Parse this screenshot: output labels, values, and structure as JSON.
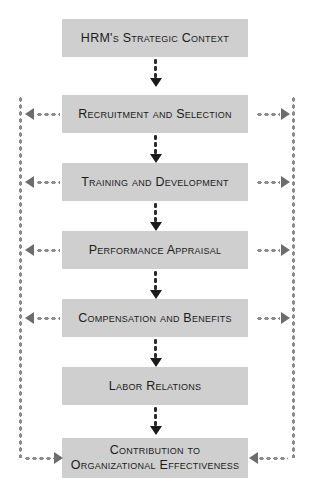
{
  "diagram": {
    "colors": {
      "box_fill": "#cfcfcf",
      "box_text": "#1b1b1b",
      "connector": "#1b1b1b",
      "feedback_rail": "#8c8c8c",
      "feedback_arrow": "#6d6d6d",
      "background": "#ffffff"
    },
    "boxes": [
      {
        "id": "hrm-strategic-context",
        "label": "HRM's Strategic Context"
      },
      {
        "id": "recruitment-and-selection",
        "label": "Recruitment and Selection"
      },
      {
        "id": "training-and-development",
        "label": "Training and Development"
      },
      {
        "id": "performance-appraisal",
        "label": "Performance Appraisal"
      },
      {
        "id": "compensation-and-benefits",
        "label": "Compensation and Benefits"
      },
      {
        "id": "labor-relations",
        "label": "Labor Relations"
      },
      {
        "id": "contribution-to-organizational-effectiveness",
        "label": "Contribution to\nOrganizational Effectiveness"
      }
    ],
    "flow_connectors": [
      {
        "from": "hrm-strategic-context",
        "to": "recruitment-and-selection",
        "style": "dotted-arrow-down"
      },
      {
        "from": "recruitment-and-selection",
        "to": "training-and-development",
        "style": "dotted-arrow-down"
      },
      {
        "from": "training-and-development",
        "to": "performance-appraisal",
        "style": "dotted-arrow-down"
      },
      {
        "from": "performance-appraisal",
        "to": "compensation-and-benefits",
        "style": "dotted-arrow-down"
      },
      {
        "from": "compensation-and-benefits",
        "to": "labor-relations",
        "style": "dotted-arrow-down"
      },
      {
        "from": "labor-relations",
        "to": "contribution-to-organizational-effectiveness",
        "style": "dotted-arrow-down"
      }
    ],
    "feedback_loops": {
      "left_rail_targets": [
        "recruitment-and-selection",
        "training-and-development",
        "performance-appraisal",
        "compensation-and-benefits"
      ],
      "right_rail_targets": [
        "recruitment-and-selection",
        "training-and-development",
        "performance-appraisal",
        "compensation-and-benefits"
      ],
      "source": "contribution-to-organizational-effectiveness",
      "arrow_direction_sides": "outward-to-rail",
      "arrow_direction_bottom": "inward-to-box"
    }
  }
}
